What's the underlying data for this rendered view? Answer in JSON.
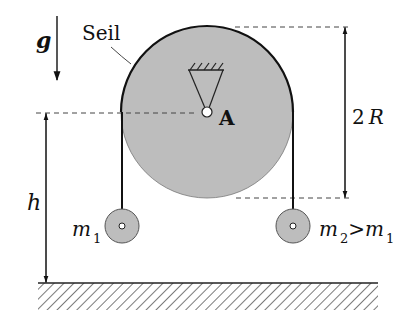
{
  "diagram": {
    "type": "pulley-system",
    "labels": {
      "gravity": "g",
      "rope": "Seil",
      "pivot": "A",
      "diameter_coeff": "2",
      "diameter_var": "R",
      "height": "h",
      "mass1_base": "m",
      "mass1_sub": "1",
      "mass2_base": "m",
      "mass2_sub": "2",
      "relation": ">",
      "mass2_rhs_base": "m",
      "mass2_rhs_sub": "1"
    },
    "colors": {
      "disk_fill": "#bdbdbd",
      "stroke": "#1a1a1a",
      "background": "#ffffff"
    }
  }
}
